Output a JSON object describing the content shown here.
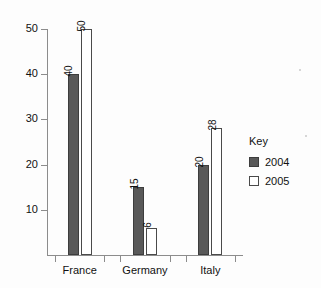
{
  "chart_data": {
    "type": "bar",
    "title": "",
    "xlabel": "",
    "ylabel": "",
    "categories": [
      "France",
      "Germany",
      "Italy"
    ],
    "series": [
      {
        "name": "2004",
        "values": [
          40,
          15,
          20
        ],
        "color": "#595959",
        "style": "filled"
      },
      {
        "name": "2005",
        "values": [
          50,
          6,
          28
        ],
        "color": "#ffffff",
        "style": "outlined"
      }
    ],
    "ylim": [
      0,
      50
    ],
    "yticks": [
      10,
      20,
      30,
      40,
      50
    ],
    "ytick_labels": [
      "10",
      "20",
      "30",
      "40",
      "50"
    ],
    "grid": false,
    "data_labels": true,
    "data_label_rotation": 90,
    "legend": {
      "title": "Key",
      "position": "right",
      "entries": [
        {
          "label": "2004",
          "swatch": "filled-dark-gray"
        },
        {
          "label": "2005",
          "swatch": "outlined-white"
        }
      ]
    },
    "axis_color": "#8c8c8c"
  },
  "legend": {
    "title": "Key",
    "items": [
      {
        "label": "2004"
      },
      {
        "label": "2005"
      }
    ]
  }
}
